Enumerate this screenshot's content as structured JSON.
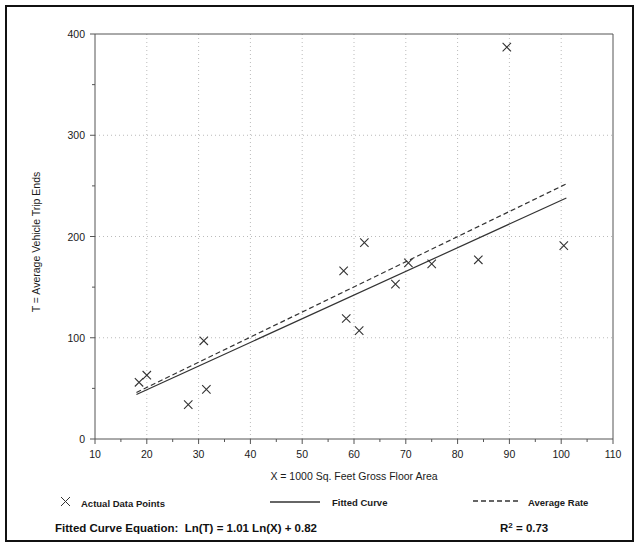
{
  "chart_data": {
    "type": "scatter",
    "title": "",
    "xlabel": "X = 1000 Sq. Feet Gross Floor Area",
    "ylabel": "T = Average Vehicle Trip Ends",
    "xlim": [
      10,
      110
    ],
    "ylim": [
      0,
      400
    ],
    "xticks": [
      10,
      20,
      30,
      40,
      50,
      60,
      70,
      80,
      90,
      100,
      110
    ],
    "yticks": [
      0,
      100,
      200,
      300,
      400
    ],
    "xtick_labels": [
      "10",
      "20",
      "30",
      "40",
      "50",
      "60",
      "70",
      "80",
      "90",
      "100",
      "110"
    ],
    "ytick_labels": [
      "0",
      "100",
      "200",
      "300",
      "400"
    ],
    "grid": "dotted-both",
    "legend_position": "below-axis",
    "points": [
      {
        "x": 18.5,
        "y": 56
      },
      {
        "x": 20.0,
        "y": 63
      },
      {
        "x": 28.0,
        "y": 34
      },
      {
        "x": 31.5,
        "y": 49
      },
      {
        "x": 31.0,
        "y": 97
      },
      {
        "x": 58.0,
        "y": 166
      },
      {
        "x": 58.5,
        "y": 119
      },
      {
        "x": 61.0,
        "y": 107
      },
      {
        "x": 62.0,
        "y": 194
      },
      {
        "x": 68.0,
        "y": 153
      },
      {
        "x": 70.5,
        "y": 174
      },
      {
        "x": 75.0,
        "y": 173
      },
      {
        "x": 84.0,
        "y": 177
      },
      {
        "x": 89.5,
        "y": 387
      },
      {
        "x": 100.5,
        "y": 191
      }
    ],
    "series": [
      {
        "name": "Fitted Curve",
        "style": "solid",
        "equation": "Ln(T) = 1.01 Ln(X) + 0.82",
        "endpoints": [
          {
            "x": 18.0,
            "y": 44
          },
          {
            "x": 101.0,
            "y": 238
          }
        ]
      },
      {
        "name": "Average Rate",
        "style": "dashed",
        "endpoints": [
          {
            "x": 18.0,
            "y": 46
          },
          {
            "x": 101.0,
            "y": 252
          }
        ]
      }
    ]
  },
  "legend": {
    "items": [
      {
        "marker": "cross",
        "label": "Actual Data Points"
      },
      {
        "marker": "solid-line",
        "label": "Fitted Curve"
      },
      {
        "marker": "dashed-line",
        "label": "Average Rate"
      }
    ]
  },
  "footer": {
    "equation_label": "Fitted Curve Equation:",
    "equation_value": "Ln(T) = 1.01 Ln(X) + 0.82",
    "r_squared_symbol": "R",
    "r_squared_exponent": "2",
    "r_squared_value": "= 0.73"
  },
  "colors": {
    "border": "#111111",
    "axis": "#555555",
    "grid": "#bbbbbb",
    "marker": "#333333",
    "line": "#333333",
    "background": "#ffffff"
  }
}
